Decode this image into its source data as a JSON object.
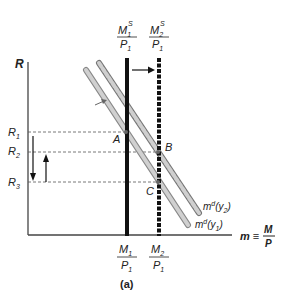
{
  "figure": {
    "panel_label": "(a)",
    "y_axis_label": "R",
    "x_axis_label": {
      "lhs": "m",
      "eq": "≡",
      "num": "M",
      "den": "P"
    },
    "r_levels": [
      {
        "name": "R",
        "sub": "1"
      },
      {
        "name": "R",
        "sub": "2"
      },
      {
        "name": "R",
        "sub": "3"
      }
    ],
    "supply_top": [
      {
        "num": "M",
        "num_sub": "1",
        "num_sup": "S",
        "den": "P",
        "den_sub": "1"
      },
      {
        "num": "M",
        "num_sub": "2",
        "num_sup": "S",
        "den": "P",
        "den_sub": "1"
      }
    ],
    "supply_bottom": [
      {
        "num": "M",
        "num_sub": "1",
        "den": "P",
        "den_sub": "1"
      },
      {
        "num": "M",
        "num_sub": "2",
        "den": "P",
        "den_sub": "1"
      }
    ],
    "points": {
      "A": "A",
      "B": "B",
      "C": "C"
    },
    "demand_curves": [
      {
        "base": "m",
        "sup": "d",
        "arg": "y",
        "arg_sub": "2"
      },
      {
        "base": "m",
        "sup": "d",
        "arg": "y",
        "arg_sub": "1"
      }
    ],
    "colors": {
      "axis": "#333333",
      "supply": "#111111",
      "demand1": "#b8b8b8",
      "demand2": "#9a9a9a",
      "dash": "#555555"
    }
  }
}
